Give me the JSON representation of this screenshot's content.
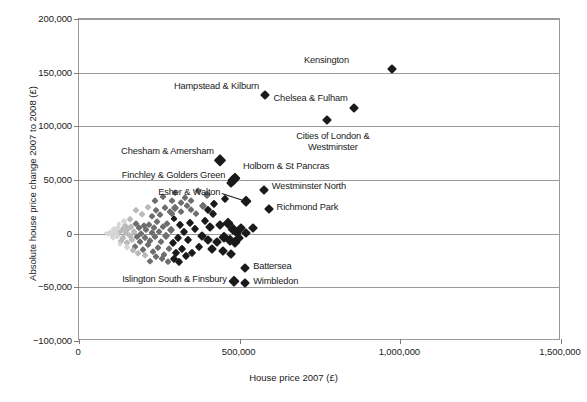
{
  "chart_data": {
    "type": "scatter",
    "title": "",
    "xlabel": "House price 2007 (£)",
    "ylabel": "Absolute house price change 2007 to 2008 (£)",
    "xlim": [
      0,
      1500000
    ],
    "ylim": [
      -100000,
      200000
    ],
    "xticks": [
      0,
      500000,
      1000000,
      1500000
    ],
    "xtick_labels": [
      "0",
      "500,000",
      "1,000,000",
      "1,500,000"
    ],
    "yticks": [
      -100000,
      -50000,
      0,
      50000,
      100000,
      150000,
      200000
    ],
    "ytick_labels": [
      "-100,000",
      "-50,000",
      "0",
      "50,000",
      "100,000",
      "150,000",
      "200,000"
    ],
    "grid": "horizontal",
    "legend": "none",
    "marker": "diamond",
    "colors": {
      "marker_dark": "#1a1a1a",
      "marker_mid": "#6e6e6e",
      "marker_light": "#b9b9b9",
      "marker_pale": "#d6d6d6",
      "grid": "#9a9a9a",
      "axis": "#7d7d7d",
      "text": "#1a1a1a"
    },
    "annotations": [
      {
        "label": "Kensington",
        "x": 975000,
        "y": 153000,
        "label_x": 840000,
        "label_y": 162000,
        "align": "right"
      },
      {
        "label": "Hampstead & Kilburn",
        "x": 580000,
        "y": 129000,
        "label_x": 560000,
        "label_y": 138000,
        "align": "right"
      },
      {
        "label": "Chelsea & Fulham",
        "x": 856000,
        "y": 117000,
        "label_x": 836000,
        "label_y": 126000,
        "align": "right"
      },
      {
        "label": "Cities of London & Westminster",
        "x": 771000,
        "y": 106000,
        "label_x": 790000,
        "label_y": 96000,
        "align": "center"
      },
      {
        "label": "Chesham & Amersham",
        "x": 440000,
        "y": 69000,
        "label_x": 420000,
        "label_y": 77000,
        "align": "right"
      },
      {
        "label": "Holborn & St Pancras",
        "x": 485000,
        "y": 52000,
        "label_x": 510000,
        "label_y": 63000,
        "align": "left"
      },
      {
        "label": "Finchley & Golders Green",
        "x": 478000,
        "y": 50000,
        "label_x": 455000,
        "label_y": 55000,
        "align": "right"
      },
      {
        "label": "Westminster North",
        "x": 575000,
        "y": 41000,
        "label_x": 600000,
        "label_y": 44000,
        "align": "left"
      },
      {
        "label": "Esher & Walton",
        "x": 519000,
        "y": 30000,
        "label_x": 440000,
        "label_y": 39000,
        "align": "right"
      },
      {
        "label": "Richmond Park",
        "x": 590000,
        "y": 23000,
        "label_x": 615000,
        "label_y": 25000,
        "align": "left"
      },
      {
        "label": "Battersea",
        "x": 516000,
        "y": -32000,
        "label_x": 542000,
        "label_y": -30000,
        "align": "left"
      },
      {
        "label": "Islington South & Finsbury",
        "x": 481000,
        "y": -44000,
        "label_x": 460000,
        "label_y": -42000,
        "align": "right"
      },
      {
        "label": "Wimbledon",
        "x": 516000,
        "y": -46000,
        "label_x": 542000,
        "label_y": -44000,
        "align": "left"
      }
    ],
    "points": [
      {
        "x": 975000,
        "y": 153000,
        "s": 4.5,
        "c": "dark"
      },
      {
        "x": 580000,
        "y": 129000,
        "s": 4.5,
        "c": "dark"
      },
      {
        "x": 856000,
        "y": 117000,
        "s": 4.5,
        "c": "dark"
      },
      {
        "x": 771000,
        "y": 106000,
        "s": 4.5,
        "c": "dark"
      },
      {
        "x": 440000,
        "y": 69000,
        "s": 5.5,
        "c": "dark"
      },
      {
        "x": 485000,
        "y": 52000,
        "s": 5.0,
        "c": "dark"
      },
      {
        "x": 478000,
        "y": 50000,
        "s": 5.0,
        "c": "dark"
      },
      {
        "x": 472000,
        "y": 47000,
        "s": 4.5,
        "c": "dark"
      },
      {
        "x": 575000,
        "y": 41000,
        "s": 4.5,
        "c": "dark"
      },
      {
        "x": 519000,
        "y": 30000,
        "s": 5.0,
        "c": "dark"
      },
      {
        "x": 590000,
        "y": 23000,
        "s": 4.5,
        "c": "dark"
      },
      {
        "x": 516000,
        "y": -32000,
        "s": 4.5,
        "c": "dark"
      },
      {
        "x": 481000,
        "y": -44000,
        "s": 5.0,
        "c": "dark"
      },
      {
        "x": 516000,
        "y": -46000,
        "s": 4.5,
        "c": "dark"
      },
      {
        "x": 455000,
        "y": 32000,
        "s": 4.0,
        "c": "dark"
      },
      {
        "x": 420000,
        "y": 28000,
        "s": 4.0,
        "c": "dark"
      },
      {
        "x": 398000,
        "y": 36000,
        "s": 4.0,
        "c": "mid"
      },
      {
        "x": 370000,
        "y": 40000,
        "s": 3.5,
        "c": "mid"
      },
      {
        "x": 350000,
        "y": 30000,
        "s": 3.5,
        "c": "mid"
      },
      {
        "x": 335000,
        "y": 26000,
        "s": 3.5,
        "c": "mid"
      },
      {
        "x": 318000,
        "y": 20000,
        "s": 3.5,
        "c": "mid"
      },
      {
        "x": 300000,
        "y": 38000,
        "s": 3.5,
        "c": "mid"
      },
      {
        "x": 288000,
        "y": 18000,
        "s": 3.5,
        "c": "mid"
      },
      {
        "x": 262000,
        "y": 34000,
        "s": 3.5,
        "c": "mid"
      },
      {
        "x": 240000,
        "y": 22000,
        "s": 3.0,
        "c": "mid"
      },
      {
        "x": 228000,
        "y": 16000,
        "s": 3.0,
        "c": "mid"
      },
      {
        "x": 465000,
        "y": 10000,
        "s": 5.0,
        "c": "dark"
      },
      {
        "x": 480000,
        "y": 4000,
        "s": 5.0,
        "c": "dark"
      },
      {
        "x": 492000,
        "y": 1000,
        "s": 4.5,
        "c": "dark"
      },
      {
        "x": 505000,
        "y": 5000,
        "s": 4.5,
        "c": "dark"
      },
      {
        "x": 520000,
        "y": 1000,
        "s": 4.5,
        "c": "dark"
      },
      {
        "x": 540000,
        "y": 5000,
        "s": 4.5,
        "c": "dark"
      },
      {
        "x": 452000,
        "y": -3000,
        "s": 5.0,
        "c": "dark"
      },
      {
        "x": 470000,
        "y": -6000,
        "s": 5.0,
        "c": "dark"
      },
      {
        "x": 485000,
        "y": -8000,
        "s": 5.0,
        "c": "dark"
      },
      {
        "x": 498000,
        "y": -4000,
        "s": 4.5,
        "c": "dark"
      },
      {
        "x": 438000,
        "y": 8000,
        "s": 4.5,
        "c": "dark"
      },
      {
        "x": 430000,
        "y": -8000,
        "s": 4.5,
        "c": "dark"
      },
      {
        "x": 448000,
        "y": -16000,
        "s": 4.5,
        "c": "dark"
      },
      {
        "x": 472000,
        "y": -19000,
        "s": 4.5,
        "c": "dark"
      },
      {
        "x": 415000,
        "y": -14000,
        "s": 4.5,
        "c": "dark"
      },
      {
        "x": 400000,
        "y": -6000,
        "s": 4.5,
        "c": "dark"
      },
      {
        "x": 408000,
        "y": 6000,
        "s": 4.5,
        "c": "dark"
      },
      {
        "x": 392000,
        "y": 12000,
        "s": 4.0,
        "c": "dark"
      },
      {
        "x": 382000,
        "y": -2000,
        "s": 4.5,
        "c": "dark"
      },
      {
        "x": 372000,
        "y": -12000,
        "s": 4.0,
        "c": "dark"
      },
      {
        "x": 360000,
        "y": 4000,
        "s": 4.0,
        "c": "dark"
      },
      {
        "x": 352000,
        "y": -18000,
        "s": 4.0,
        "c": "dark"
      },
      {
        "x": 345000,
        "y": 10000,
        "s": 4.0,
        "c": "dark"
      },
      {
        "x": 340000,
        "y": -6000,
        "s": 4.0,
        "c": "dark"
      },
      {
        "x": 333000,
        "y": -21000,
        "s": 4.0,
        "c": "dark"
      },
      {
        "x": 326000,
        "y": 2000,
        "s": 4.0,
        "c": "dark"
      },
      {
        "x": 320000,
        "y": -14000,
        "s": 4.0,
        "c": "dark"
      },
      {
        "x": 314000,
        "y": 8000,
        "s": 4.0,
        "c": "dark"
      },
      {
        "x": 308000,
        "y": -4000,
        "s": 4.0,
        "c": "dark"
      },
      {
        "x": 302000,
        "y": -18000,
        "s": 4.0,
        "c": "dark"
      },
      {
        "x": 296000,
        "y": 14000,
        "s": 3.5,
        "c": "dark"
      },
      {
        "x": 292000,
        "y": -9000,
        "s": 4.0,
        "c": "dark"
      },
      {
        "x": 286000,
        "y": 3000,
        "s": 4.0,
        "c": "mid"
      },
      {
        "x": 280000,
        "y": -14000,
        "s": 3.5,
        "c": "mid"
      },
      {
        "x": 275000,
        "y": 9000,
        "s": 3.5,
        "c": "mid"
      },
      {
        "x": 270000,
        "y": -2000,
        "s": 4.0,
        "c": "mid"
      },
      {
        "x": 265000,
        "y": -20000,
        "s": 3.5,
        "c": "mid"
      },
      {
        "x": 260000,
        "y": 6000,
        "s": 3.5,
        "c": "mid"
      },
      {
        "x": 256000,
        "y": -8000,
        "s": 3.5,
        "c": "mid"
      },
      {
        "x": 250000,
        "y": 2000,
        "s": 3.5,
        "c": "mid"
      },
      {
        "x": 246000,
        "y": -13000,
        "s": 3.5,
        "c": "mid"
      },
      {
        "x": 242000,
        "y": 11000,
        "s": 3.5,
        "c": "mid"
      },
      {
        "x": 238000,
        "y": -3000,
        "s": 3.5,
        "c": "mid"
      },
      {
        "x": 234000,
        "y": 5000,
        "s": 3.5,
        "c": "mid"
      },
      {
        "x": 230000,
        "y": -17000,
        "s": 3.5,
        "c": "mid"
      },
      {
        "x": 226000,
        "y": 1000,
        "s": 3.5,
        "c": "mid"
      },
      {
        "x": 222000,
        "y": -7000,
        "s": 3.5,
        "c": "mid"
      },
      {
        "x": 218000,
        "y": 8000,
        "s": 3.5,
        "c": "mid"
      },
      {
        "x": 214000,
        "y": -11000,
        "s": 3.5,
        "c": "mid"
      },
      {
        "x": 210000,
        "y": 3000,
        "s": 3.5,
        "c": "mid"
      },
      {
        "x": 206000,
        "y": -4000,
        "s": 3.5,
        "c": "mid"
      },
      {
        "x": 202000,
        "y": 7000,
        "s": 3.5,
        "c": "mid"
      },
      {
        "x": 198000,
        "y": -15000,
        "s": 3.5,
        "c": "mid"
      },
      {
        "x": 194000,
        "y": 0,
        "s": 3.5,
        "c": "mid"
      },
      {
        "x": 190000,
        "y": -8000,
        "s": 3.5,
        "c": "mid"
      },
      {
        "x": 186000,
        "y": 5000,
        "s": 3.5,
        "c": "mid"
      },
      {
        "x": 182000,
        "y": -3000,
        "s": 3.5,
        "c": "mid"
      },
      {
        "x": 178000,
        "y": 9000,
        "s": 3.5,
        "c": "mid"
      },
      {
        "x": 174000,
        "y": -12000,
        "s": 3.5,
        "c": "mid"
      },
      {
        "x": 170000,
        "y": 2000,
        "s": 3.5,
        "c": "light"
      },
      {
        "x": 166000,
        "y": -6000,
        "s": 3.5,
        "c": "light"
      },
      {
        "x": 162000,
        "y": 6000,
        "s": 3.5,
        "c": "light"
      },
      {
        "x": 158000,
        "y": -2000,
        "s": 3.5,
        "c": "light"
      },
      {
        "x": 154000,
        "y": 4000,
        "s": 3.5,
        "c": "light"
      },
      {
        "x": 150000,
        "y": -9000,
        "s": 3.5,
        "c": "light"
      },
      {
        "x": 146000,
        "y": 1000,
        "s": 3.5,
        "c": "light"
      },
      {
        "x": 142000,
        "y": 7000,
        "s": 3.5,
        "c": "light"
      },
      {
        "x": 138000,
        "y": -4000,
        "s": 3.5,
        "c": "light"
      },
      {
        "x": 134000,
        "y": 3000,
        "s": 3.5,
        "c": "light"
      },
      {
        "x": 130000,
        "y": -7000,
        "s": 3.0,
        "c": "light"
      },
      {
        "x": 126000,
        "y": 2000,
        "s": 3.0,
        "c": "light"
      },
      {
        "x": 122000,
        "y": 5000,
        "s": 3.0,
        "c": "pale"
      },
      {
        "x": 118000,
        "y": -2000,
        "s": 3.0,
        "c": "pale"
      },
      {
        "x": 114000,
        "y": 1000,
        "s": 3.0,
        "c": "pale"
      },
      {
        "x": 110000,
        "y": 4000,
        "s": 3.0,
        "c": "pale"
      },
      {
        "x": 106000,
        "y": -3000,
        "s": 3.0,
        "c": "pale"
      },
      {
        "x": 102000,
        "y": 0,
        "s": 3.0,
        "c": "pale"
      },
      {
        "x": 96000,
        "y": 2000,
        "s": 2.5,
        "c": "pale"
      },
      {
        "x": 90000,
        "y": 0,
        "s": 2.5,
        "c": "pale"
      },
      {
        "x": 84000,
        "y": 1000,
        "s": 2.0,
        "c": "pale"
      },
      {
        "x": 300000,
        "y": 24000,
        "s": 4.0,
        "c": "mid"
      },
      {
        "x": 290000,
        "y": 30000,
        "s": 3.5,
        "c": "mid"
      },
      {
        "x": 282000,
        "y": 20000,
        "s": 3.5,
        "c": "mid"
      },
      {
        "x": 268000,
        "y": 24000,
        "s": 3.5,
        "c": "mid"
      },
      {
        "x": 252000,
        "y": 17000,
        "s": 3.5,
        "c": "mid"
      },
      {
        "x": 236000,
        "y": 30000,
        "s": 3.5,
        "c": "mid"
      },
      {
        "x": 215000,
        "y": 25000,
        "s": 3.0,
        "c": "light"
      },
      {
        "x": 195000,
        "y": 18000,
        "s": 3.0,
        "c": "light"
      },
      {
        "x": 176000,
        "y": 22000,
        "s": 3.0,
        "c": "light"
      },
      {
        "x": 160000,
        "y": 14000,
        "s": 3.0,
        "c": "light"
      },
      {
        "x": 140000,
        "y": 12000,
        "s": 3.0,
        "c": "pale"
      },
      {
        "x": 124000,
        "y": 9000,
        "s": 2.5,
        "c": "pale"
      },
      {
        "x": 310000,
        "y": -26000,
        "s": 4.0,
        "c": "dark"
      },
      {
        "x": 295000,
        "y": -24000,
        "s": 4.0,
        "c": "dark"
      },
      {
        "x": 276000,
        "y": -26000,
        "s": 3.5,
        "c": "mid"
      },
      {
        "x": 258000,
        "y": -24000,
        "s": 3.5,
        "c": "mid"
      },
      {
        "x": 240000,
        "y": -22000,
        "s": 3.5,
        "c": "mid"
      },
      {
        "x": 222000,
        "y": -25000,
        "s": 3.0,
        "c": "mid"
      },
      {
        "x": 205000,
        "y": -20000,
        "s": 3.0,
        "c": "light"
      },
      {
        "x": 185000,
        "y": -18000,
        "s": 3.0,
        "c": "light"
      },
      {
        "x": 168000,
        "y": -15000,
        "s": 3.0,
        "c": "light"
      },
      {
        "x": 148000,
        "y": -12000,
        "s": 3.0,
        "c": "pale"
      },
      {
        "x": 128000,
        "y": -10000,
        "s": 2.5,
        "c": "pale"
      },
      {
        "x": 418000,
        "y": 18000,
        "s": 4.0,
        "c": "dark"
      },
      {
        "x": 402000,
        "y": 22000,
        "s": 4.0,
        "c": "dark"
      },
      {
        "x": 386000,
        "y": 26000,
        "s": 4.0,
        "c": "mid"
      },
      {
        "x": 364000,
        "y": 18000,
        "s": 3.5,
        "c": "mid"
      },
      {
        "x": 348000,
        "y": 22000,
        "s": 3.5,
        "c": "mid"
      },
      {
        "x": 330000,
        "y": 33000,
        "s": 3.5,
        "c": "mid"
      },
      {
        "x": 316000,
        "y": 29000,
        "s": 3.5,
        "c": "mid"
      }
    ]
  }
}
